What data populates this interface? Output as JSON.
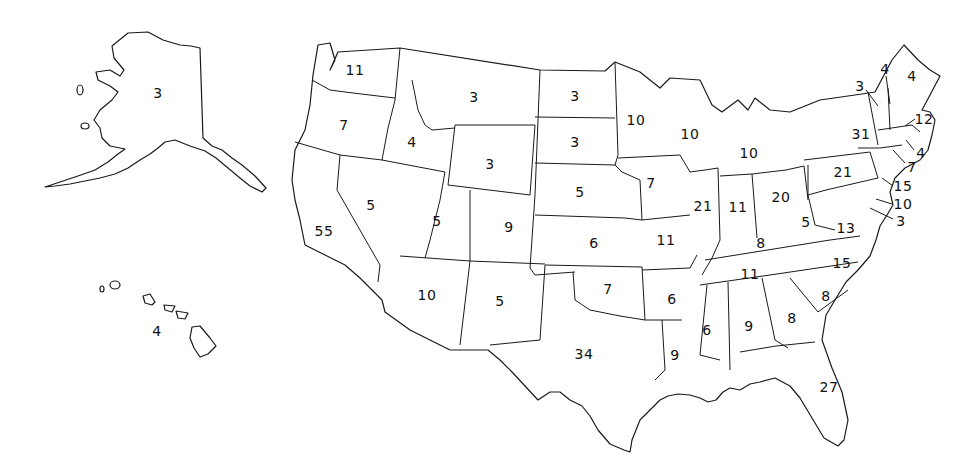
{
  "map": {
    "title": "",
    "background": "#ffffff",
    "line_color": "#1a1a1a",
    "states": [
      {
        "id": "AK",
        "value": "3",
        "x": 158,
        "y": 93
      },
      {
        "id": "HI",
        "value": "4",
        "x": 157,
        "y": 331
      },
      {
        "id": "WA",
        "value": "11",
        "x": 355,
        "y": 70
      },
      {
        "id": "OR",
        "value": "7",
        "x": 344,
        "y": 125
      },
      {
        "id": "CA",
        "value": "55",
        "x": 324,
        "y": 231
      },
      {
        "id": "ID",
        "value": "4",
        "x": 412,
        "y": 142
      },
      {
        "id": "NV",
        "value": "5",
        "x": 371,
        "y": 205
      },
      {
        "id": "MT",
        "value": "3",
        "x": 474,
        "y": 97
      },
      {
        "id": "WY",
        "value": "3",
        "x": 490,
        "y": 164
      },
      {
        "id": "UT",
        "value": "5",
        "x": 437,
        "y": 221
      },
      {
        "id": "AZ",
        "value": "10",
        "x": 427,
        "y": 295
      },
      {
        "id": "CO",
        "value": "9",
        "x": 509,
        "y": 227
      },
      {
        "id": "NM",
        "value": "5",
        "x": 500,
        "y": 301
      },
      {
        "id": "ND",
        "value": "3",
        "x": 575,
        "y": 96
      },
      {
        "id": "SD",
        "value": "3",
        "x": 575,
        "y": 142
      },
      {
        "id": "NE",
        "value": "5",
        "x": 580,
        "y": 192
      },
      {
        "id": "KS",
        "value": "6",
        "x": 594,
        "y": 243
      },
      {
        "id": "OK",
        "value": "7",
        "x": 608,
        "y": 289
      },
      {
        "id": "TX",
        "value": "34",
        "x": 584,
        "y": 354
      },
      {
        "id": "MN",
        "value": "10",
        "x": 636,
        "y": 120
      },
      {
        "id": "IA",
        "value": "7",
        "x": 651,
        "y": 183
      },
      {
        "id": "MO",
        "value": "11",
        "x": 666,
        "y": 240
      },
      {
        "id": "AR",
        "value": "6",
        "x": 672,
        "y": 299
      },
      {
        "id": "LA",
        "value": "9",
        "x": 675,
        "y": 355
      },
      {
        "id": "WI",
        "value": "10",
        "x": 690,
        "y": 134
      },
      {
        "id": "IL",
        "value": "21",
        "x": 703,
        "y": 206
      },
      {
        "id": "MI",
        "value": "10",
        "x": 749,
        "y": 153
      },
      {
        "id": "IN",
        "value": "11",
        "x": 738,
        "y": 207
      },
      {
        "id": "OH",
        "value": "20",
        "x": 781,
        "y": 197
      },
      {
        "id": "KY",
        "value": "8",
        "x": 761,
        "y": 243
      },
      {
        "id": "TN",
        "value": "11",
        "x": 750,
        "y": 274
      },
      {
        "id": "MS",
        "value": "6",
        "x": 707,
        "y": 330
      },
      {
        "id": "AL",
        "value": "9",
        "x": 749,
        "y": 326
      },
      {
        "id": "GA",
        "value": "8",
        "x": 792,
        "y": 318
      },
      {
        "id": "FL",
        "value": "27",
        "x": 829,
        "y": 387
      },
      {
        "id": "SC",
        "value": "8",
        "x": 826,
        "y": 296
      },
      {
        "id": "NC",
        "value": "15",
        "x": 842,
        "y": 263
      },
      {
        "id": "VA",
        "value": "13",
        "x": 846,
        "y": 228
      },
      {
        "id": "WV",
        "value": "5",
        "x": 806,
        "y": 222
      },
      {
        "id": "PA",
        "value": "21",
        "x": 843,
        "y": 172
      },
      {
        "id": "NY",
        "value": "31",
        "x": 861,
        "y": 134
      },
      {
        "id": "VT",
        "value": "3",
        "x": 860,
        "y": 86
      },
      {
        "id": "NH",
        "value": "4",
        "x": 885,
        "y": 69
      },
      {
        "id": "ME",
        "value": "4",
        "x": 912,
        "y": 76
      },
      {
        "id": "MA",
        "value": "12",
        "x": 924,
        "y": 119
      },
      {
        "id": "RI",
        "value": "4",
        "x": 921,
        "y": 153
      },
      {
        "id": "CT",
        "value": "7",
        "x": 912,
        "y": 167
      },
      {
        "id": "NJ",
        "value": "15",
        "x": 903,
        "y": 186
      },
      {
        "id": "DE",
        "value": "10",
        "x": 903,
        "y": 204
      },
      {
        "id": "MD",
        "value": "3",
        "x": 901,
        "y": 221
      }
    ]
  }
}
